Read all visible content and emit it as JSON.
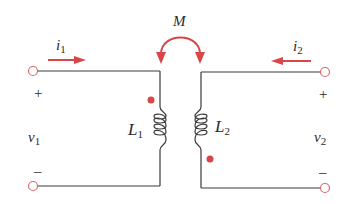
{
  "diagram": {
    "type": "coupled-inductors-circuit",
    "mutual_inductance_label": "M",
    "current_1": {
      "symbol": "i",
      "subscript": "1",
      "direction": "right"
    },
    "current_2": {
      "symbol": "i",
      "subscript": "2",
      "direction": "left"
    },
    "voltage_1": {
      "symbol": "v",
      "subscript": "1",
      "plus": "+",
      "minus": "–"
    },
    "voltage_2": {
      "symbol": "v",
      "subscript": "2",
      "plus": "+",
      "minus": "–"
    },
    "inductor_1": {
      "symbol": "L",
      "subscript": "1",
      "dot": "top"
    },
    "inductor_2": {
      "symbol": "L",
      "subscript": "2",
      "dot": "bottom"
    },
    "colors": {
      "wire": "#3a3a3a",
      "accent": "#d9464a",
      "terminal": "#d96a6e",
      "text": "#2a2a2a"
    }
  }
}
